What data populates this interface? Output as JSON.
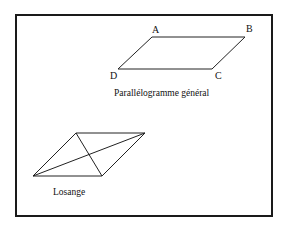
{
  "frame": {
    "x": 16,
    "y": 15,
    "width": 256,
    "height": 201,
    "stroke": "#1a1a1a"
  },
  "parallelogram": {
    "caption": "Parallélogramme général",
    "vertices": {
      "A": {
        "label": "A",
        "x": 152,
        "y": 37
      },
      "B": {
        "label": "B",
        "x": 245,
        "y": 37
      },
      "C": {
        "label": "C",
        "x": 212,
        "y": 69
      },
      "D": {
        "label": "D",
        "x": 118,
        "y": 69
      }
    }
  },
  "rhombus": {
    "caption": "Losange",
    "vertices": [
      {
        "x": 76,
        "y": 133
      },
      {
        "x": 145,
        "y": 133
      },
      {
        "x": 102,
        "y": 176
      },
      {
        "x": 33,
        "y": 176
      }
    ]
  }
}
